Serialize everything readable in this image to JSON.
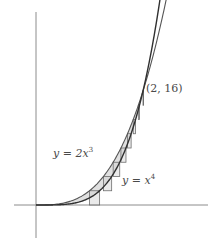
{
  "figure": {
    "name": "region-between-curves-riemann-shells",
    "background": "#ffffff",
    "width": 208,
    "height": 241
  },
  "axes": {
    "color": "#8c8c8c",
    "x_axis": {
      "x1": 14,
      "y1": 205,
      "x2": 208,
      "y2": 205
    },
    "y_axis": {
      "x1": 36,
      "y1": 12,
      "x2": 36,
      "y2": 238
    },
    "origin": {
      "x": 36,
      "y": 205
    }
  },
  "labels": {
    "curve_upper": {
      "text": "y = 2x^3",
      "y_sym": "y",
      "equals": "=",
      "expr": "2x",
      "exponent": "3",
      "x": 53,
      "y": 147,
      "color": "#4a4a4a"
    },
    "curve_lower": {
      "text": "y = x^4",
      "y_sym": "y",
      "equals": "=",
      "expr": "x",
      "exponent": "4",
      "x": 122,
      "y": 174,
      "color": "#4a4a4a"
    },
    "intersection_point": {
      "text": "(2, 16)",
      "x": 146,
      "y": 83,
      "color": "#4a4a4a"
    }
  },
  "chart_data": {
    "type": "line",
    "title": "",
    "xlabel": "",
    "ylabel": "",
    "grid": false,
    "legend": "inline-annotations",
    "xlim": [
      -0.3,
      2.6
    ],
    "ylim": [
      -2,
      34
    ],
    "intersections": [
      {
        "x": 0,
        "y": 0
      },
      {
        "x": 2,
        "y": 16
      }
    ],
    "series": [
      {
        "name": "y = 2x^3",
        "equation": "y = 2*x^3",
        "color": "#555555",
        "x": [
          0,
          0.2,
          0.4,
          0.6,
          0.8,
          1.0,
          1.2,
          1.4,
          1.6,
          1.8,
          2.0,
          2.2,
          2.4,
          2.5
        ],
        "values": [
          0,
          0.016,
          0.128,
          0.432,
          1.024,
          2.0,
          3.456,
          5.488,
          8.192,
          11.664,
          16.0,
          21.296,
          27.648,
          31.25
        ]
      },
      {
        "name": "y = x^4",
        "equation": "y = x^4",
        "color": "#333333",
        "x": [
          0,
          0.2,
          0.4,
          0.6,
          0.8,
          1.0,
          1.2,
          1.4,
          1.6,
          1.8,
          2.0,
          2.2,
          2.4,
          2.5
        ],
        "values": [
          0,
          0.0016,
          0.0256,
          0.1296,
          0.4096,
          1.0,
          2.0736,
          3.8416,
          6.5536,
          10.4976,
          16.0,
          23.4256,
          33.1776,
          39.0625
        ]
      }
    ],
    "shaded_region": {
      "between": [
        "y = 2x^3",
        "y = x^4"
      ],
      "x_range": [
        0,
        2
      ],
      "fill": "#d6d6d6",
      "opacity": 0.75
    },
    "rectangles": {
      "orientation": "horizontal",
      "count": 8,
      "stroke": "#6e6e6e",
      "fill": "#d0d0d0",
      "fill_opacity": 0.45,
      "y_values": [
        0,
        2,
        4,
        6,
        8,
        10,
        12,
        14
      ],
      "y_step": 2,
      "note": "Each strip runs from x = (y/2)^(1/3) on the left to x = y^(1/4) on the right, drawn at the lower edge of each y-slab."
    }
  }
}
